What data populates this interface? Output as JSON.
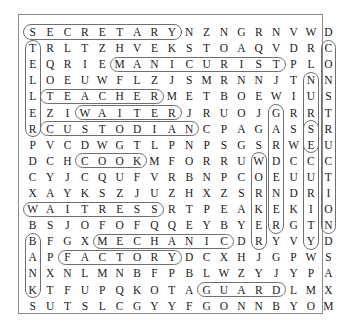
{
  "document": {
    "type": "word-search-puzzle",
    "title": "",
    "grid_rows": 17,
    "grid_cols": 17,
    "border_color": "#8a8a8a",
    "highlight_color": "#6f6f6f",
    "text_color": "#1a1a1a"
  },
  "grid": [
    [
      "S",
      "E",
      "C",
      "R",
      "E",
      "T",
      "A",
      "R",
      "Y",
      "N",
      "Z",
      "N",
      "G",
      "R",
      "N",
      "V",
      "W",
      "D"
    ],
    [
      "T",
      "R",
      "L",
      "T",
      "Z",
      "H",
      "V",
      "E",
      "K",
      "S",
      "T",
      "O",
      "A",
      "Q",
      "V",
      "D",
      "R",
      "C"
    ],
    [
      "E",
      "Q",
      "R",
      "I",
      "E",
      "M",
      "A",
      "N",
      "I",
      "C",
      "U",
      "R",
      "I",
      "S",
      "T",
      "P",
      "L",
      "O"
    ],
    [
      "L",
      "O",
      "E",
      "U",
      "W",
      "F",
      "L",
      "Z",
      "J",
      "S",
      "M",
      "R",
      "N",
      "N",
      "J",
      "T",
      "N",
      "N"
    ],
    [
      "L",
      "T",
      "E",
      "A",
      "C",
      "H",
      "E",
      "R",
      "M",
      "E",
      "T",
      "B",
      "O",
      "E",
      "W",
      "I",
      "U",
      "S"
    ],
    [
      "E",
      "Z",
      "I",
      "W",
      "A",
      "I",
      "T",
      "E",
      "R",
      "J",
      "R",
      "U",
      "O",
      "J",
      "G",
      "R",
      "R",
      "T"
    ],
    [
      "R",
      "C",
      "U",
      "S",
      "T",
      "O",
      "D",
      "I",
      "A",
      "N",
      "C",
      "P",
      "A",
      "G",
      "A",
      "S",
      "S",
      "R"
    ],
    [
      "P",
      "V",
      "C",
      "D",
      "W",
      "G",
      "T",
      "L",
      "P",
      "N",
      "P",
      "S",
      "G",
      "S",
      "R",
      "W",
      "E",
      "U"
    ],
    [
      "D",
      "C",
      "H",
      "C",
      "O",
      "O",
      "K",
      "M",
      "F",
      "O",
      "R",
      "R",
      "U",
      "W",
      "D",
      "C",
      "C",
      "C"
    ],
    [
      "C",
      "Y",
      "J",
      "C",
      "Q",
      "U",
      "F",
      "V",
      "R",
      "B",
      "N",
      "P",
      "C",
      "O",
      "E",
      "U",
      "U",
      "T"
    ],
    [
      "X",
      "A",
      "Y",
      "K",
      "S",
      "Z",
      "J",
      "U",
      "Z",
      "H",
      "X",
      "Z",
      "S",
      "R",
      "N",
      "D",
      "R",
      "I"
    ],
    [
      "W",
      "A",
      "I",
      "T",
      "R",
      "E",
      "S",
      "S",
      "R",
      "T",
      "P",
      "E",
      "A",
      "K",
      "E",
      "K",
      "I",
      "O"
    ],
    [
      "B",
      "S",
      "J",
      "O",
      "F",
      "O",
      "F",
      "Q",
      "Q",
      "E",
      "Y",
      "B",
      "Y",
      "E",
      "R",
      "G",
      "T",
      "N"
    ],
    [
      "B",
      "F",
      "G",
      "X",
      "M",
      "E",
      "C",
      "H",
      "A",
      "N",
      "I",
      "C",
      "D",
      "R",
      "Y",
      "V",
      "Y",
      "D"
    ],
    [
      "A",
      "P",
      "F",
      "A",
      "C",
      "T",
      "O",
      "R",
      "Y",
      "D",
      "C",
      "X",
      "H",
      "J",
      "G",
      "P",
      "W",
      "S"
    ],
    [
      "N",
      "X",
      "N",
      "L",
      "M",
      "N",
      "B",
      "F",
      "P",
      "B",
      "L",
      "W",
      "Z",
      "Y",
      "J",
      "Y",
      "P",
      "A"
    ],
    [
      "K",
      "T",
      "F",
      "U",
      "P",
      "Q",
      "K",
      "O",
      "T",
      "A",
      "G",
      "U",
      "A",
      "R",
      "D",
      "L",
      "M",
      "X"
    ],
    [
      "S",
      "U",
      "T",
      "S",
      "L",
      "C",
      "G",
      "Y",
      "Y",
      "F",
      "G",
      "O",
      "N",
      "N",
      "B",
      "Y",
      "O",
      "M"
    ]
  ],
  "found_words": [
    {
      "word": "SECRETARY",
      "direction": "horizontal",
      "row": 0,
      "col": 0,
      "length": 9
    },
    {
      "word": "MANICURIST",
      "direction": "horizontal",
      "row": 2,
      "col": 5,
      "length": 10
    },
    {
      "word": "TEACHER",
      "direction": "horizontal",
      "row": 4,
      "col": 1,
      "length": 7
    },
    {
      "word": "WAITER",
      "direction": "horizontal",
      "row": 5,
      "col": 3,
      "length": 6
    },
    {
      "word": "CUSTODIAN",
      "direction": "horizontal",
      "row": 6,
      "col": 1,
      "length": 9
    },
    {
      "word": "COOK",
      "direction": "horizontal",
      "row": 8,
      "col": 3,
      "length": 4
    },
    {
      "word": "WAITRESS",
      "direction": "horizontal",
      "row": 11,
      "col": 0,
      "length": 8
    },
    {
      "word": "MECHANIC",
      "direction": "horizontal",
      "row": 13,
      "col": 4,
      "length": 8
    },
    {
      "word": "FACTORY",
      "direction": "horizontal",
      "row": 14,
      "col": 2,
      "length": 7
    },
    {
      "word": "GUARD",
      "direction": "horizontal",
      "row": 16,
      "col": 10,
      "length": 5
    },
    {
      "word": "TELLER",
      "direction": "vertical",
      "row": 1,
      "col": 0,
      "length": 6
    },
    {
      "word": "BANK",
      "direction": "vertical",
      "row": 13,
      "col": 0,
      "length": 4
    },
    {
      "word": "CONSTRUCTION",
      "direction": "vertical",
      "row": 1,
      "col": 17,
      "length": 12
    },
    {
      "word": "NURSE",
      "direction": "vertical",
      "row": 3,
      "col": 16,
      "length": 5
    },
    {
      "word": "SECURITY",
      "direction": "vertical",
      "row": 6,
      "col": 16,
      "length": 8
    },
    {
      "word": "GARDENER",
      "direction": "vertical",
      "row": 5,
      "col": 14,
      "length": 8
    },
    {
      "word": "WORKER",
      "direction": "vertical",
      "row": 8,
      "col": 13,
      "length": 6
    }
  ]
}
